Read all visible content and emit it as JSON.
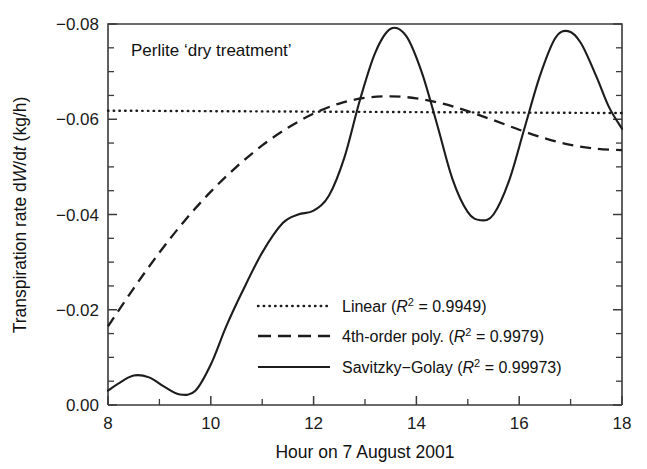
{
  "figure": {
    "panel_title": "Perlite ‘dry treatment’",
    "background": "#ffffff",
    "ink_color": "#1c1c1c"
  },
  "axes": {
    "x": {
      "label": "Hour on 7 August 2001",
      "min": 8,
      "max": 18,
      "major_ticks": [
        8,
        10,
        12,
        14,
        16,
        18
      ],
      "major_tick_labels": [
        "8",
        "10",
        "12",
        "14",
        "16",
        "18"
      ],
      "minor_ticks": [
        9,
        11,
        13,
        15,
        17
      ]
    },
    "y": {
      "label_parts": {
        "pre": "Transpiration rate d",
        "var1": "W",
        "mid": "/d",
        "var2": "t",
        "post": " (kg/h)"
      },
      "label_plain": "Transpiration rate dW/dt (kg/h)",
      "min": -0.08,
      "max": 0.0,
      "inverted": true,
      "major_ticks": [
        -0.08,
        -0.06,
        -0.04,
        -0.02,
        0.0
      ],
      "major_tick_labels": [
        "−0.08",
        "−0.06",
        "−0.04",
        "−0.02",
        "0.00"
      ],
      "minor_ticks": [
        -0.075,
        -0.07,
        -0.065,
        -0.055,
        -0.05,
        -0.045,
        -0.035,
        -0.03,
        -0.025,
        -0.015,
        -0.01,
        -0.005
      ]
    }
  },
  "legend": {
    "position": "inside-lower-center",
    "items": [
      {
        "name": "linear",
        "label": "Linear",
        "r2_text": "0.9949",
        "style": "dotted",
        "full_text": "Linear (R² = 0.9949)"
      },
      {
        "name": "poly4",
        "label": "4th-order poly.",
        "r2_text": "0.9979",
        "style": "dashed",
        "full_text": "4th-order poly. (R² = 0.9979)"
      },
      {
        "name": "savitzky-golay",
        "label": "Savitzky−Golay",
        "r2_text": "0.99973",
        "style": "solid",
        "full_text": "Savitzky−Golay (R² = 0.99973)"
      }
    ]
  },
  "chart_data": {
    "type": "line",
    "title": "Perlite ‘dry treatment’",
    "xlabel": "Hour on 7 August 2001",
    "ylabel": "Transpiration rate dW/dt (kg/h)",
    "xlim": [
      8,
      18
    ],
    "ylim": [
      -0.08,
      0.0
    ],
    "y_axis_inverted": true,
    "grid": false,
    "legend_position": "inside-lower-center",
    "series": [
      {
        "name": "Linear",
        "style": "dotted",
        "r2": 0.9949,
        "x": [
          8,
          18
        ],
        "y": [
          -0.0618,
          -0.0613
        ]
      },
      {
        "name": "4th-order poly.",
        "style": "dashed",
        "r2": 0.9979,
        "x": [
          8,
          8.5,
          9,
          9.5,
          10,
          10.5,
          11,
          11.5,
          12,
          12.5,
          13,
          13.5,
          14,
          14.5,
          15,
          15.5,
          16,
          16.5,
          17,
          17.5,
          18
        ],
        "y": [
          -0.0165,
          -0.0245,
          -0.032,
          -0.0388,
          -0.0448,
          -0.05,
          -0.0545,
          -0.0582,
          -0.0612,
          -0.0633,
          -0.0645,
          -0.0648,
          -0.0644,
          -0.0633,
          -0.0617,
          -0.0598,
          -0.0578,
          -0.056,
          -0.0546,
          -0.0538,
          -0.0535
        ]
      },
      {
        "name": "Savitzky−Golay",
        "style": "solid",
        "r2": 0.99973,
        "x": [
          8,
          8.2,
          8.5,
          8.8,
          9.1,
          9.4,
          9.7,
          10,
          10.3,
          10.6,
          11,
          11.4,
          11.7,
          12,
          12.3,
          12.6,
          12.9,
          13.2,
          13.5,
          13.8,
          14.1,
          14.4,
          14.7,
          15,
          15.25,
          15.5,
          15.8,
          16.1,
          16.4,
          16.7,
          16.95,
          17.2,
          17.5,
          17.75,
          18
        ],
        "y": [
          -0.003,
          -0.0045,
          -0.0062,
          -0.0058,
          -0.0038,
          -0.0022,
          -0.003,
          -0.0085,
          -0.0165,
          -0.0235,
          -0.032,
          -0.0382,
          -0.04,
          -0.0408,
          -0.044,
          -0.052,
          -0.064,
          -0.074,
          -0.079,
          -0.0775,
          -0.07,
          -0.059,
          -0.0475,
          -0.0405,
          -0.0388,
          -0.04,
          -0.047,
          -0.058,
          -0.069,
          -0.077,
          -0.0785,
          -0.076,
          -0.069,
          -0.0625,
          -0.058
        ]
      }
    ]
  }
}
